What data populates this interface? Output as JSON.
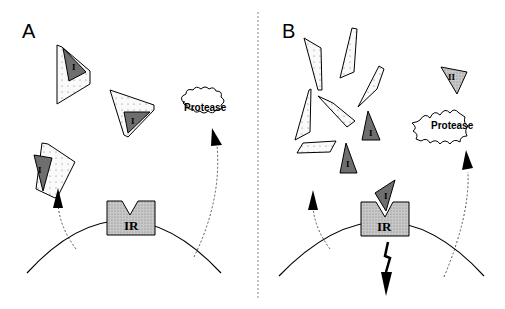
{
  "figure": {
    "panels": [
      {
        "id": "A",
        "label": "A",
        "receptor_label": "IR",
        "protease_label": "Protease",
        "protease_shape": "cloud (inactive)",
        "complex_labels": [
          "I",
          "I",
          "I"
        ],
        "description": "Intact inhibitor-protein complexes (dark triangle I bound in dotted chevron) released from cell; receptor unoccupied; protease inactive"
      },
      {
        "id": "B",
        "label": "B",
        "receptor_label": "IR",
        "protease_label": "Protease",
        "protease_shape": "starburst (active)",
        "free_ligand_labels": [
          "I",
          "I"
        ],
        "bound_ligand_label": "I",
        "other_ligand_label": "II",
        "description": "Protease active, cleaves complex into fragments; free ligand I binds IR, triggering downstream signal (lightning arrow)"
      }
    ],
    "colors": {
      "line": "#000000",
      "dark_fill": "#6e6e6e",
      "gray_fill": "#bdbdbd",
      "dotted_fill": "#f4f4f4",
      "divider": "#888888"
    }
  }
}
